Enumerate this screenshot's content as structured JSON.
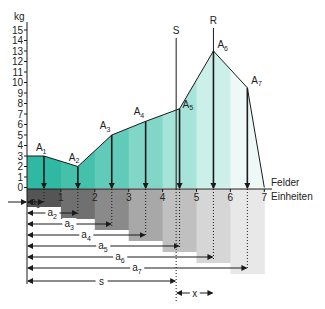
{
  "diagram": {
    "y_axis": {
      "unit": "kg",
      "ticks": [
        0,
        1,
        2,
        3,
        4,
        5,
        6,
        7,
        8,
        9,
        10,
        11,
        12,
        13,
        14,
        15
      ]
    },
    "x_axis": {
      "label_line1": "Felder",
      "label_line2": "Einheiten",
      "ticks": [
        1,
        2,
        3,
        4,
        5,
        6,
        7
      ]
    },
    "profile_points": [
      {
        "x": 0,
        "y": 3
      },
      {
        "x": 0.5,
        "y": 3
      },
      {
        "x": 1.5,
        "y": 2
      },
      {
        "x": 2.5,
        "y": 5
      },
      {
        "x": 3.5,
        "y": 6.3
      },
      {
        "x": 4.5,
        "y": 7.5
      },
      {
        "x": 5.5,
        "y": 13
      },
      {
        "x": 6.5,
        "y": 9.5
      },
      {
        "x": 7,
        "y": 0
      }
    ],
    "loads": [
      {
        "name": "A",
        "sub": "1",
        "x": 0.5,
        "y": 3
      },
      {
        "name": "A",
        "sub": "2",
        "x": 1.5,
        "y": 2
      },
      {
        "name": "A",
        "sub": "3",
        "x": 2.5,
        "y": 5
      },
      {
        "name": "A",
        "sub": "4",
        "x": 3.5,
        "y": 6.3
      },
      {
        "name": "A",
        "sub": "5",
        "x": 4.5,
        "y": 7.5
      },
      {
        "name": "A",
        "sub": "6",
        "x": 5.5,
        "y": 13
      },
      {
        "name": "A",
        "sub": "7",
        "x": 6.5,
        "y": 9.5
      }
    ],
    "distances": [
      {
        "name": "a",
        "sub": "1",
        "to": 0.5
      },
      {
        "name": "a",
        "sub": "2",
        "to": 1.5
      },
      {
        "name": "a",
        "sub": "3",
        "to": 2.5
      },
      {
        "name": "a",
        "sub": "4",
        "to": 3.5
      },
      {
        "name": "a",
        "sub": "5",
        "to": 4.5
      },
      {
        "name": "a",
        "sub": "6",
        "to": 5.5
      },
      {
        "name": "a",
        "sub": "7",
        "to": 6.5
      }
    ],
    "s_line": {
      "label": "S",
      "x": 4.4
    },
    "r_line": {
      "label": "R",
      "x": 5.5
    },
    "s_distance": {
      "label": "s",
      "to": 4.4
    },
    "x_distance": {
      "label": "x",
      "from": 4.4,
      "to": 5.5
    },
    "colors": {
      "fill_bands": [
        "#2fb8a2",
        "#45c0ab",
        "#62cab8",
        "#82d6c7",
        "#a6e3d9",
        "#cdefea",
        "#eef9f7"
      ],
      "gray_bands": [
        "#555555",
        "#707070",
        "#8a8a8a",
        "#a8a8a8",
        "#c0c0c0",
        "#d6d6d6",
        "#e8e8e8"
      ],
      "line": "#1a1a1a"
    }
  }
}
